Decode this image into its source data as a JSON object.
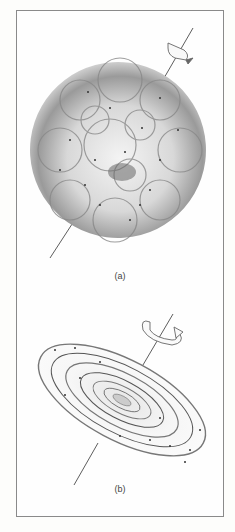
{
  "figure": {
    "panels": [
      {
        "id": "a",
        "label": "(a)",
        "description": "Roughly spherical clumpy gas cloud with scattered stars, rotating slowly about a tilted axis"
      },
      {
        "id": "b",
        "label": "(b)",
        "description": "Flattened rotating spiral disk with concentric arms and stars, spinning faster about a tilted axis"
      }
    ],
    "colors": {
      "ink": "#444444",
      "frame": "#8a8a8a",
      "background": "#fefefe"
    }
  }
}
